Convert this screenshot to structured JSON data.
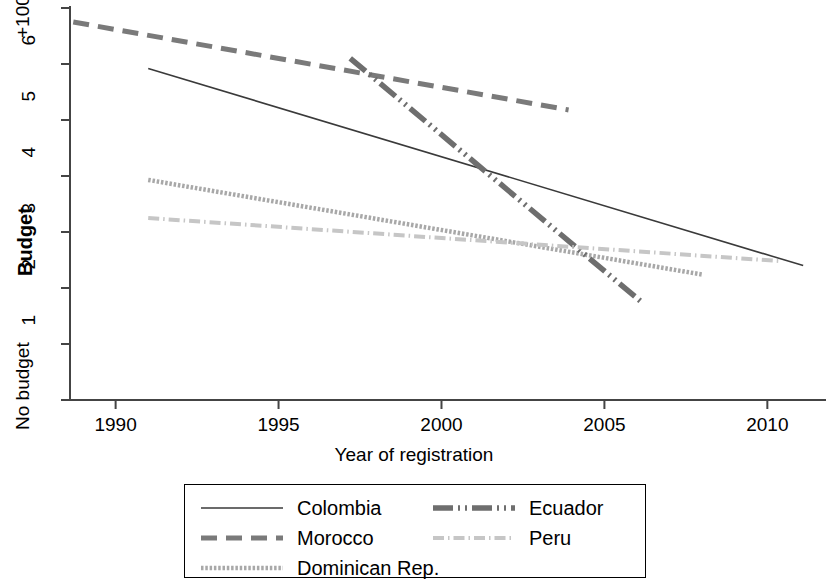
{
  "chart_data": {
    "type": "line",
    "title": "",
    "xlabel": "Year of registration",
    "ylabel": "Budget",
    "xlim": [
      1988.6,
      2011.8
    ],
    "ylim": [
      0,
      7
    ],
    "grid": false,
    "legend_position": "bottom",
    "xticks": [
      1990,
      1995,
      2000,
      2005,
      2010
    ],
    "xtick_labels": [
      "1990",
      "1995",
      "2000",
      "2005",
      "2010"
    ],
    "yticks": [
      0,
      1,
      2,
      3,
      4,
      5,
      6,
      7
    ],
    "ytick_labels": [
      "No budget",
      "1",
      "2",
      "3",
      "4",
      "5",
      "6",
      "+100.000"
    ],
    "series": [
      {
        "name": "Colombia",
        "style": "solid",
        "color": "#3a3a3a",
        "width": 1.6,
        "x": [
          1991.0,
          2011.1
        ],
        "y": [
          5.92,
          2.4
        ]
      },
      {
        "name": "Morocco",
        "style": "dashed",
        "color": "#7a7a7a",
        "width": 5.0,
        "x": [
          1988.7,
          2003.9
        ],
        "y": [
          6.75,
          5.18
        ]
      },
      {
        "name": "Dominican Rep.",
        "style": "fine-dash",
        "color": "#a8a8a8",
        "width": 4.5,
        "x": [
          1991.0,
          2008.0
        ],
        "y": [
          3.93,
          2.24
        ]
      },
      {
        "name": "Ecuador",
        "style": "dash-dot-dot",
        "color": "#6e6e6e",
        "width": 5.5,
        "x": [
          1997.2,
          2006.1
        ],
        "y": [
          6.1,
          1.77
        ]
      },
      {
        "name": "Peru",
        "style": "dash-dot",
        "color": "#c6c6c6",
        "width": 4.0,
        "x": [
          1991.0,
          2010.4
        ],
        "y": [
          3.25,
          2.48
        ]
      }
    ],
    "annotations": []
  },
  "axes": {
    "y_axis_label": "Budget",
    "x_axis_label": "Year of registration",
    "y_tick_top": "+100.000",
    "y_tick_6": "6",
    "y_tick_5": "5",
    "y_tick_4": "4",
    "y_tick_3": "3",
    "y_tick_2": "2",
    "y_tick_1": "1",
    "y_tick_zero": "No budget",
    "x_tick_1990": "1990",
    "x_tick_1995": "1995",
    "x_tick_2000": "2000",
    "x_tick_2005": "2005",
    "x_tick_2010": "2010"
  },
  "legend": {
    "entries": [
      {
        "label": "Colombia",
        "key": "solid-line-key"
      },
      {
        "label": "Ecuador",
        "key": "dash-dot-dot-line-key"
      },
      {
        "label": "Morocco",
        "key": "dashed-line-key"
      },
      {
        "label": "Peru",
        "key": "dash-dot-line-key"
      },
      {
        "label": "Dominican Rep.",
        "key": "fine-dash-line-key"
      }
    ]
  }
}
